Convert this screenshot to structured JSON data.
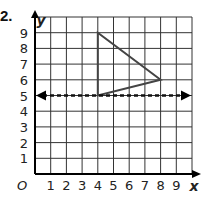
{
  "problem_number": "2.",
  "axes": {
    "x_label": "x",
    "y_label": "y",
    "origin_label": "O",
    "x_ticks": [
      "1",
      "2",
      "3",
      "4",
      "5",
      "6",
      "7",
      "8",
      "9"
    ],
    "y_ticks": [
      "1",
      "2",
      "3",
      "4",
      "5",
      "6",
      "7",
      "8",
      "9"
    ],
    "x_range": [
      0,
      10
    ],
    "y_range": [
      0,
      10
    ]
  },
  "figure": {
    "triangle_vertices": [
      [
        4,
        9
      ],
      [
        4,
        5
      ],
      [
        8,
        6
      ]
    ],
    "line_of_reflection": {
      "y": 5,
      "style": "dashed",
      "arrows": "both"
    }
  },
  "colors": {
    "grid": "#333333",
    "triangle": "#444444",
    "dashed_line": "#111111"
  }
}
